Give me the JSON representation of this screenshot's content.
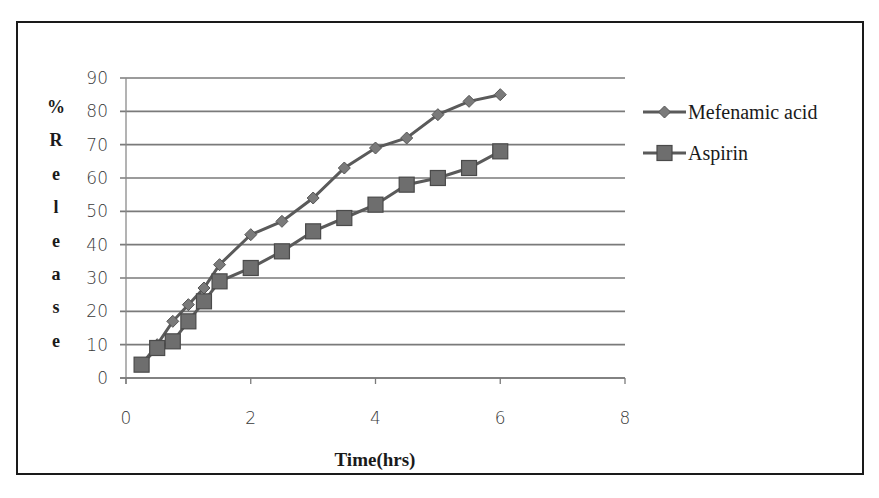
{
  "chart_data": {
    "type": "line",
    "title": "",
    "xlabel": "Time(hrs)",
    "ylabel": "% Release",
    "ylabel_letters": [
      "%",
      "R",
      "e",
      "l",
      "e",
      "a",
      "s",
      "e"
    ],
    "xlim": [
      0,
      8
    ],
    "ylim": [
      0,
      90
    ],
    "x_ticks": [
      "0",
      "2",
      "4",
      "6",
      "8"
    ],
    "y_ticks": [
      "0",
      "10",
      "20",
      "30",
      "40",
      "50",
      "60",
      "70",
      "80",
      "90"
    ],
    "grid": "horizontal",
    "legend_position": "right",
    "x": [
      0.25,
      0.5,
      0.75,
      1,
      1.25,
      1.5,
      2,
      2.5,
      3,
      3.5,
      4,
      4.5,
      5,
      5.5,
      6
    ],
    "series": [
      {
        "name": "Mefenamic acid",
        "marker": "diamond",
        "color": "#6b6b6b",
        "values": [
          4,
          10,
          17,
          22,
          27,
          34,
          43,
          47,
          54,
          63,
          69,
          72,
          79,
          83,
          85
        ]
      },
      {
        "name": "Aspirin",
        "marker": "square",
        "color": "#6b6b6b",
        "values": [
          4,
          9,
          11,
          17,
          23,
          29,
          33,
          38,
          44,
          48,
          52,
          58,
          60,
          63,
          68
        ]
      }
    ]
  }
}
